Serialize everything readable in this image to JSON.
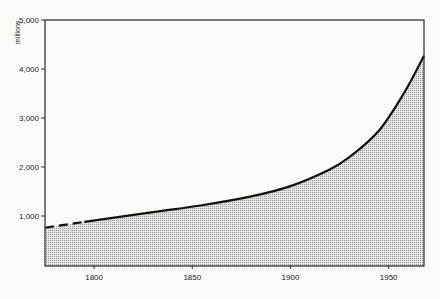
{
  "chart_data": {
    "type": "area",
    "title": "",
    "xlabel": "",
    "ylabel": "millions",
    "xlim": [
      1775,
      1968
    ],
    "ylim": [
      0,
      5000
    ],
    "grid": false,
    "legend": null,
    "x_ticks": [
      1800,
      1850,
      1900,
      1950
    ],
    "x_tick_labels": [
      "1800",
      "1850",
      "1900",
      "1950"
    ],
    "y_ticks": [
      1000,
      2000,
      3000,
      4000,
      5000
    ],
    "y_tick_labels": [
      "1,000",
      "2,000",
      "3,000",
      "4,000",
      "5,000"
    ],
    "series": [
      {
        "name": "World population",
        "style_note": "dashed before ~1795, solid after; area below shaded with stipple",
        "x": [
          1775,
          1795,
          1830,
          1855,
          1880,
          1900,
          1920,
          1930,
          1945,
          1958,
          1968
        ],
        "values": [
          760,
          880,
          1080,
          1220,
          1400,
          1610,
          1950,
          2200,
          2740,
          3520,
          4270
        ]
      }
    ],
    "annotations": [
      {
        "text": "dashed segment indicates estimate",
        "x_range": [
          1775,
          1795
        ]
      }
    ]
  },
  "axes": {
    "y_unit_label": "millions"
  }
}
